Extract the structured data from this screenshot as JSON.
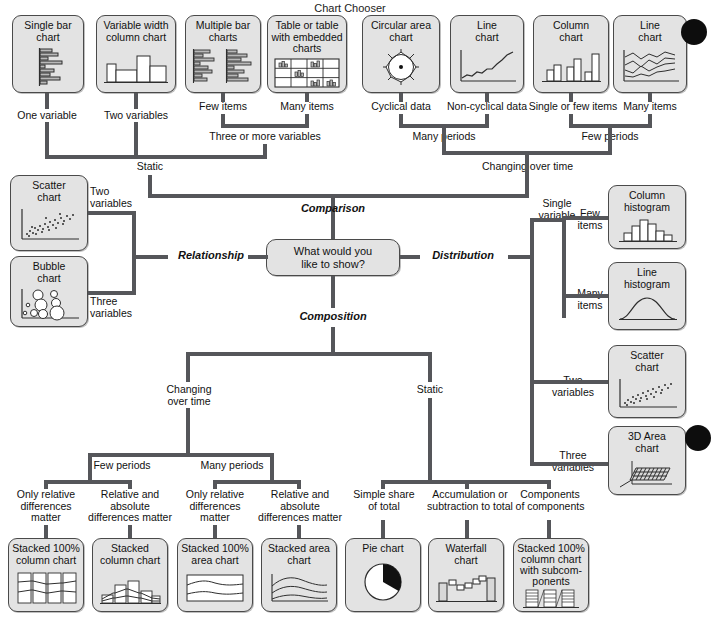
{
  "title": "Chart Chooser",
  "center": {
    "question": "What would you\nlike to show?"
  },
  "branches": {
    "comparison": "Comparison",
    "relationship": "Relationship",
    "distribution": "Distribution",
    "composition": "Composition"
  },
  "cards": {
    "single_bar": "Single bar\nchart",
    "variable_width_column": "Variable width\ncolumn chart",
    "multiple_bar": "Multiple bar\ncharts",
    "table_embedded": "Table or table\nwith embedded\ncharts",
    "circular_area": "Circular area\nchart",
    "line_noncyclical": "Line\nchart",
    "column_chart": "Column\nchart",
    "line_many_items": "Line\nchart",
    "scatter_rel": "Scatter\nchart",
    "bubble": "Bubble\nchart",
    "column_histogram": "Column\nhistogram",
    "line_histogram": "Line\nhistogram",
    "scatter_dist": "Scatter\nchart",
    "area_3d": "3D Area\nchart",
    "stacked_100_column": "Stacked 100%\ncolumn chart",
    "stacked_column": "Stacked\ncolumn chart",
    "stacked_100_area": "Stacked 100%\narea chart",
    "stacked_area": "Stacked area\nchart",
    "pie": "Pie chart",
    "waterfall": "Waterfall\nchart",
    "stacked_100_sub": "Stacked 100%\ncolumn chart\nwith subcom-\nponents"
  },
  "edge_labels": {
    "one_variable": "One variable",
    "two_variables_top": "Two variables",
    "few_items_top": "Few items",
    "many_items_top": "Many items",
    "three_or_more_variables": "Three or more variables",
    "static_comparison": "Static",
    "cyclical_data": "Cyclical data",
    "non_cyclical_data": "Non-cyclical data",
    "single_or_few_items": "Single or few items",
    "many_items_time": "Many items",
    "many_periods_top": "Many periods",
    "few_periods_top": "Few periods",
    "changing_over_time_top": "Changing over time",
    "two_variables_rel": "Two\nvariables",
    "three_variables_rel": "Three\nvariables",
    "single_variable": "Single\nvariable",
    "few_items_dist": "Few\nitems",
    "many_items_dist": "Many\nitems",
    "two_variables_dist": "Two\nvariables",
    "three_variables_dist": "Three\nvariables",
    "changing_over_time_comp": "Changing\nover time",
    "static_comp": "Static",
    "few_periods_comp": "Few periods",
    "many_periods_comp": "Many periods",
    "only_relative_1": "Only relative\ndifferences\nmatter",
    "relative_absolute_1": "Relative and\nabsolute\ndifferences matter",
    "only_relative_2": "Only relative\ndifferences\nmatter",
    "relative_absolute_2": "Relative and\nabsolute\ndifferences matter",
    "simple_share": "Simple share\nof total",
    "accumulation": "Accumulation or\nsubtraction to total",
    "components": "Components\nof components"
  },
  "colors": {
    "card_fill": "#e3e3e3",
    "card_border": "#4a4a4a",
    "connector": "#55565a",
    "text": "#111111",
    "artifact_dot": "#0d0d0d"
  }
}
